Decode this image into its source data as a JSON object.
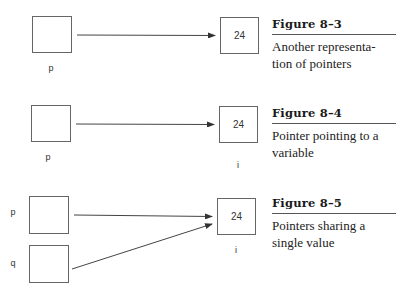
{
  "figures": [
    {
      "id": "8-3",
      "title": "Figure 8–3",
      "caption_line1": "Another representa-",
      "caption_line2": "tion of pointers",
      "pointers": [
        {
          "label": "p"
        }
      ],
      "target": {
        "value": "24",
        "label": ""
      }
    },
    {
      "id": "8-4",
      "title": "Figure 8–4",
      "caption_line1": "Pointer pointing to a",
      "caption_line2": "variable",
      "pointers": [
        {
          "label": "p"
        }
      ],
      "target": {
        "value": "24",
        "label": "i"
      }
    },
    {
      "id": "8-5",
      "title": "Figure 8–5",
      "caption_line1": "Pointers sharing a",
      "caption_line2": "single value",
      "pointers": [
        {
          "label": "p"
        },
        {
          "label": "q"
        }
      ],
      "target": {
        "value": "24",
        "label": "i"
      }
    }
  ],
  "colors": {
    "stroke": "#555555",
    "arrow": "#333333",
    "rule": "#555555"
  }
}
